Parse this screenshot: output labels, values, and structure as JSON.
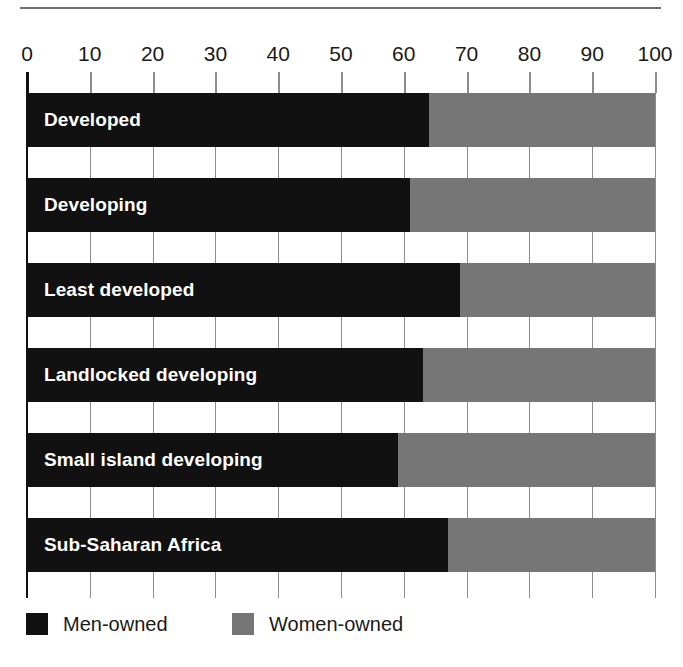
{
  "chart_data": {
    "type": "bar",
    "orientation": "horizontal",
    "stacked": true,
    "normalized_percent": true,
    "title": "",
    "subtitle": "",
    "xlabel": "",
    "ylabel": "",
    "xlim": [
      0,
      100
    ],
    "grid": true,
    "legend_position": "bottom-left",
    "categories": [
      "Developed",
      "Developing",
      "Least developed",
      "Landlocked developing",
      "Small island developing",
      "Sub-Saharan Africa"
    ],
    "tick_labels": [
      "0",
      "10",
      "20",
      "30",
      "40",
      "50",
      "60",
      "70",
      "80",
      "90",
      "100"
    ],
    "tick_values": [
      0,
      10,
      20,
      30,
      40,
      50,
      60,
      70,
      80,
      90,
      100
    ],
    "series": [
      {
        "name": "Men-owned",
        "color": "#111111",
        "values": [
          64,
          61,
          69,
          63,
          59,
          67
        ]
      },
      {
        "name": "Women-owned",
        "color": "#767676",
        "values": [
          36,
          39,
          31,
          37,
          41,
          33
        ]
      }
    ]
  },
  "legend": {
    "items": [
      {
        "label": "Men-owned",
        "color": "#111111"
      },
      {
        "label": "Women-owned",
        "color": "#767676"
      }
    ]
  },
  "colors": {
    "men": "#111111",
    "women": "#767676",
    "gridline": "#8c8c8c",
    "axis": "#111111",
    "rule": "#6e6e6e",
    "text": "#1a1a1a",
    "bar_label": "#ffffff",
    "background": "#ffffff"
  }
}
